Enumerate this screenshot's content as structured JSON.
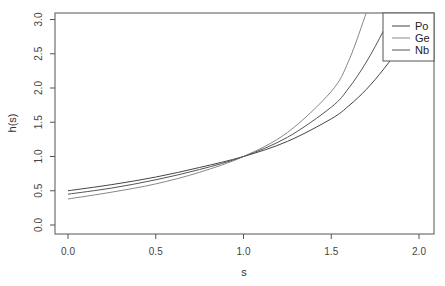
{
  "chart_data": {
    "type": "line",
    "title": "",
    "xlabel": "s",
    "ylabel": "h(s)",
    "xlim": [
      -0.06,
      2.06
    ],
    "ylim": [
      -0.1,
      3.1
    ],
    "xticks": [
      "0.0",
      "0.5",
      "1.0",
      "1.5",
      "2.0"
    ],
    "yticks": [
      "0.0",
      "0.5",
      "1.0",
      "1.5",
      "2.0",
      "2.5",
      "3.0"
    ],
    "grid": false,
    "legend_position": "top-right",
    "x": [
      0.0,
      0.25,
      0.5,
      0.75,
      1.0,
      1.25,
      1.5,
      1.6,
      1.7,
      1.8,
      1.9,
      2.0
    ],
    "series": [
      {
        "name": "Po",
        "color": "#444444",
        "values": [
          0.5,
          0.59,
          0.7,
          0.84,
          1.0,
          1.22,
          1.55,
          1.74,
          1.98,
          2.28,
          2.63,
          3.05
        ]
      },
      {
        "name": "Ge",
        "color": "#777777",
        "values": [
          0.38,
          0.48,
          0.6,
          0.77,
          1.0,
          1.35,
          1.95,
          2.4,
          3.1,
          null,
          null,
          null
        ]
      },
      {
        "name": "Nb",
        "color": "#555555",
        "values": [
          0.45,
          0.54,
          0.66,
          0.81,
          1.0,
          1.28,
          1.72,
          2.0,
          2.38,
          2.85,
          3.4,
          null
        ]
      }
    ]
  },
  "axes": {
    "xlabel": "s",
    "ylabel": "h(s)",
    "xticks": [
      "0.0",
      "0.5",
      "1.0",
      "1.5",
      "2.0"
    ],
    "yticks": [
      "0.0",
      "0.5",
      "1.0",
      "1.5",
      "2.0",
      "2.5",
      "3.0"
    ]
  },
  "legend": {
    "items": [
      {
        "label": "Po",
        "color": "#444444"
      },
      {
        "label": "Ge",
        "color": "#777777"
      },
      {
        "label": "Nb",
        "color": "#555555"
      }
    ]
  }
}
